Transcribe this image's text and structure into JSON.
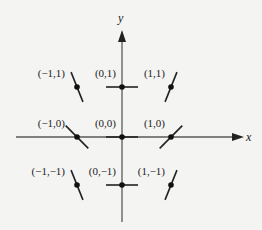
{
  "axes": {
    "x_label": "x",
    "y_label": "y",
    "color": "#5a5a5a"
  },
  "slope_field": {
    "segment_color": "#222222",
    "points": [
      {
        "label": "(−1,1)",
        "x": -1,
        "y": 1,
        "slope": -2.5
      },
      {
        "label": "(0,1)",
        "x": 0,
        "y": 1,
        "slope": 0
      },
      {
        "label": "(1,1)",
        "x": 1,
        "y": 1,
        "slope": 2.5
      },
      {
        "label": "(−1,0)",
        "x": -1,
        "y": 0,
        "slope": -1
      },
      {
        "label": "(0,0)",
        "x": 0,
        "y": 0,
        "slope": 0
      },
      {
        "label": "(1,0)",
        "x": 1,
        "y": 0,
        "slope": 1
      },
      {
        "label": "(−1,−1)",
        "x": -1,
        "y": -1,
        "slope": -2.5
      },
      {
        "label": "(0,−1)",
        "x": 0,
        "y": -1,
        "slope": 0
      },
      {
        "label": "(1,−1)",
        "x": 1,
        "y": -1,
        "slope": 2.5
      }
    ]
  }
}
